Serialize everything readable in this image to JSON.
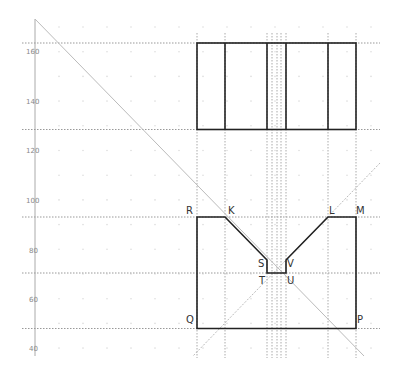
{
  "chart_data": {
    "type": "diagram",
    "title": "",
    "y_axis": {
      "ticks": [
        160,
        140,
        120,
        100,
        80,
        60,
        40
      ],
      "tick_y_px": [
        52,
        102,
        151,
        201,
        251,
        300,
        349
      ],
      "axis_x_px": 35,
      "axis_top_px": 19,
      "axis_bottom_px": 356
    },
    "colors": {
      "outline": "#222222",
      "guides": "#999999",
      "axis": "#aaaaaa",
      "labels": "#333333",
      "tick_labels": "#888888"
    },
    "guide_lines": {
      "horizontal_y_px": [
        43,
        129.5,
        217,
        273,
        328.5
      ],
      "vertical_x_px": [
        197,
        225,
        267,
        272,
        277,
        281,
        286,
        328,
        356
      ],
      "diagonals": [
        {
          "x1": 35,
          "y1": 19,
          "x2": 364,
          "y2": 356
        },
        {
          "x1": 380,
          "y1": 163,
          "x2": 193,
          "y2": 356
        }
      ]
    },
    "top_view": {
      "rect": {
        "x": 197,
        "y": 43,
        "w": 159,
        "h": 86.5
      },
      "dividers_x_px": [
        225,
        267,
        286,
        328
      ]
    },
    "front_view": {
      "points": [
        {
          "name": "R",
          "x": 197,
          "y": 217
        },
        {
          "name": "K",
          "x": 225,
          "y": 217
        },
        {
          "name": "S",
          "x": 267,
          "y": 260
        },
        {
          "name": "T",
          "x": 267,
          "y": 273
        },
        {
          "name": "U",
          "x": 286,
          "y": 273
        },
        {
          "name": "V",
          "x": 286,
          "y": 260
        },
        {
          "name": "L",
          "x": 328,
          "y": 217
        },
        {
          "name": "M",
          "x": 356,
          "y": 217
        },
        {
          "name": "P",
          "x": 356,
          "y": 328.5
        },
        {
          "name": "Q",
          "x": 197,
          "y": 328.5
        }
      ]
    }
  },
  "labels": {
    "y160": "160",
    "y140": "140",
    "y120": "120",
    "y100": "100",
    "y80": "80",
    "y60": "60",
    "y40": "40",
    "R": "R",
    "K": "K",
    "L": "L",
    "M": "M",
    "S": "S",
    "V": "V",
    "T": "T",
    "U": "U",
    "Q": "Q",
    "P": "P"
  }
}
